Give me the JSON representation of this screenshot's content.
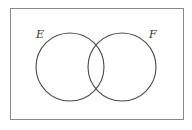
{
  "diagram": {
    "type": "venn",
    "universe": {
      "x": 10,
      "y": 8,
      "width": 173,
      "height": 111,
      "stroke": "#8a8a8a"
    },
    "sets": [
      {
        "label": "E",
        "cx": 70,
        "cy": 67,
        "r": 34,
        "label_x": 30,
        "label_y": 37
      },
      {
        "label": "F",
        "cx": 122,
        "cy": 67,
        "r": 34,
        "label_x": 148,
        "label_y": 37
      }
    ],
    "stroke_color": "#4a4a4a"
  }
}
